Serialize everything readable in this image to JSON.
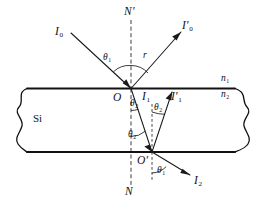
{
  "figure": {
    "material_label": "Si",
    "medium_upper_index": "n",
    "medium_upper_sub": "1",
    "medium_lower_index": "n",
    "medium_lower_sub": "2",
    "background_color": "#ffffff",
    "line_color": "#1a1a1a"
  },
  "normals": {
    "upper_label": "N",
    "upper_prime": "′",
    "lower_label": "N"
  },
  "points": [
    {
      "id": "O",
      "label": "O",
      "prime": "",
      "x": 131,
      "y": 88
    },
    {
      "id": "Oprime",
      "label": "O",
      "prime": "′",
      "x": 152,
      "y": 152
    }
  ],
  "rays": [
    {
      "id": "incident",
      "label": "I",
      "sub": "0",
      "prime": "",
      "label_x": 55,
      "label_y": 26
    },
    {
      "id": "reflected",
      "label": "I",
      "sub": "0",
      "prime": "′",
      "label_x": 182,
      "label_y": 21
    },
    {
      "id": "refracted-internal",
      "label": "I",
      "sub": "1",
      "prime": "",
      "label_x": 143,
      "label_y": 92
    },
    {
      "id": "internal-reflected",
      "label": "I",
      "sub": "1",
      "prime": "′",
      "label_x": 173,
      "label_y": 92
    },
    {
      "id": "transmitted",
      "label": "I",
      "sub": "2",
      "prime": "",
      "label_x": 194,
      "label_y": 176
    }
  ],
  "angles": [
    {
      "id": "theta1-incident",
      "label": "θ",
      "sub": "1",
      "x": 105,
      "y": 58
    },
    {
      "id": "r-reflected",
      "label": "r",
      "sub": "",
      "x": 143,
      "y": 57
    },
    {
      "id": "theta2-upper-left",
      "label": "θ",
      "sub": "2",
      "x": 134,
      "y": 102
    },
    {
      "id": "theta2-upper-right",
      "label": "θ",
      "sub": "2",
      "x": 157,
      "y": 105
    },
    {
      "id": "theta2-lower",
      "label": "θ",
      "sub": "2",
      "x": 132,
      "y": 133
    },
    {
      "id": "theta1-transmitted",
      "label": "θ",
      "sub": "1",
      "x": 159,
      "y": 170
    }
  ],
  "media": {
    "upper_x": 224,
    "upper_y": 79,
    "lower_x": 224,
    "lower_y": 92,
    "material_x": 28,
    "material_y": 113
  }
}
